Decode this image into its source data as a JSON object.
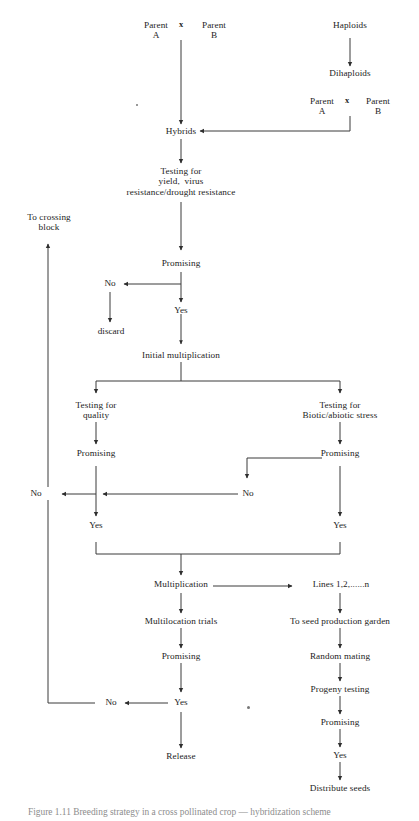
{
  "figure": {
    "type": "flowchart",
    "caption": "Figure 1.11  Breeding strategy in a cross pollinated crop — hybridization scheme",
    "line_color": "#3a3a3a",
    "text_color": "#232323",
    "background": "#ffffff"
  },
  "nodes": {
    "parent_a_top": "Parent\nA",
    "cross_symbol_top": "x",
    "parent_b_top": "Parent\nB",
    "haploids": "Haploids",
    "dihaploids": "Dihaploids",
    "parent_a_dh": "Parent\nA",
    "cross_symbol_dh": "x",
    "parent_b_dh": "Parent\nB",
    "hybrids": "Hybrids",
    "testing_yield": "Testing for\nyield,  virus\nresistance/drought resistance",
    "promising_1": "Promising",
    "no_1": "No",
    "yes_1": "Yes",
    "discard": "discard",
    "to_crossing_block": "To crossing\nblock",
    "initial_multiplication": "Initial multiplication",
    "testing_quality": "Testing for\nquality",
    "testing_stress": "Testing for\nBiotic/abiotic stress",
    "promising_quality": "Promising",
    "promising_stress": "Promising",
    "no_left": "No",
    "no_right": "No",
    "yes_quality": "Yes",
    "yes_stress": "Yes",
    "multiplication": "Multiplication",
    "lines_n": "Lines 1,2,......n",
    "multilocation_trials": "Multilocation trials",
    "promising_trials": "Promising",
    "no_trials": "No",
    "yes_trials": "Yes",
    "release": "Release",
    "seed_production_garden": "To seed production garden",
    "random_mating": "Random mating",
    "progeny_testing": "Progeny testing",
    "promising_progeny": "Promising",
    "yes_progeny": "Yes",
    "distribute_seeds": "Distribute seeds"
  }
}
